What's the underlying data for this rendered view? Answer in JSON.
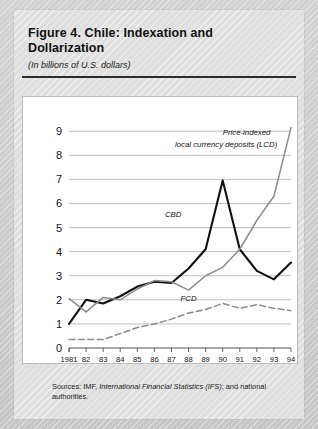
{
  "figure": {
    "title": "Figure 4.  Chile: Indexation and Dollarization",
    "subtitle": "(In billions of U.S. dollars)",
    "sources_prefix": "Sources: IMF, ",
    "sources_italic": "International Financial Statistics (IFS)",
    "sources_suffix": "; and national authorities."
  },
  "colors": {
    "cbd": "#111111",
    "lcd": "#8c8c8c",
    "fcd": "#8c8c8c",
    "grid": "#b8b8b8",
    "axis": "#555555",
    "panel_bg": "#ffffff",
    "page_bg": "#d6d6d6"
  },
  "chart_data": {
    "type": "line",
    "title": "Figure 4.  Chile: Indexation and Dollarization",
    "subtitle": "(In billions of U.S. dollars)",
    "xlabel": "",
    "ylabel": "",
    "x": [
      1981,
      1982,
      1983,
      1984,
      1985,
      1986,
      1987,
      1988,
      1989,
      1990,
      1991,
      1992,
      1993,
      1994
    ],
    "xtick_labels": [
      "1981",
      "82",
      "83",
      "84",
      "85",
      "86",
      "87",
      "88",
      "89",
      "90",
      "91",
      "92",
      "93",
      "94"
    ],
    "ytick_labels": [
      "0",
      "1",
      "2",
      "3",
      "4",
      "5",
      "6",
      "7",
      "8",
      "9"
    ],
    "ylim": [
      0,
      9.3
    ],
    "yticks": [
      0,
      1,
      2,
      3,
      4,
      5,
      6,
      7,
      8,
      9
    ],
    "grid": true,
    "grid_axis": "y",
    "legend": "inline-annotations",
    "series": [
      {
        "name": "CBD",
        "label": "CBD",
        "style": "solid",
        "color": "#111111",
        "width": 2.1,
        "values": [
          1.0,
          2.0,
          1.85,
          2.15,
          2.55,
          2.75,
          2.7,
          3.3,
          4.1,
          6.95,
          4.1,
          3.2,
          2.85,
          3.55
        ]
      },
      {
        "name": "LCD",
        "label": "Price-indexed local currency deposits (LCD)",
        "label_line1": "Price-indexed",
        "label_line2": "local currency deposits (LCD)",
        "style": "solid",
        "color": "#8c8c8c",
        "width": 1.5,
        "values": [
          2.05,
          1.5,
          2.1,
          2.0,
          2.45,
          2.8,
          2.75,
          2.4,
          3.0,
          3.35,
          4.1,
          5.3,
          6.3,
          9.15
        ]
      },
      {
        "name": "FCD",
        "label": "FCD",
        "style": "dashed",
        "color": "#8c8c8c",
        "width": 1.5,
        "values": [
          0.35,
          0.35,
          0.35,
          0.6,
          0.85,
          1.0,
          1.2,
          1.45,
          1.6,
          1.85,
          1.65,
          1.8,
          1.65,
          1.55
        ]
      }
    ],
    "annotations": [
      {
        "text": "CBD",
        "x": 1987.1,
        "y": 5.45
      },
      {
        "text": "Price-indexed",
        "x": 1991.4,
        "y": 8.85
      },
      {
        "text": "local currency deposits (LCD)",
        "x": 1990.2,
        "y": 8.35
      },
      {
        "text": "FCD",
        "x": 1988.0,
        "y": 1.95
      }
    ]
  }
}
